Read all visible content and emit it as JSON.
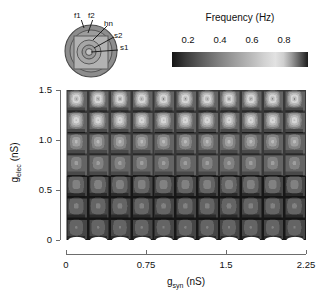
{
  "figure": {
    "inset": {
      "name": "neuron-schematic",
      "labels": [
        {
          "id": "f1",
          "text": "f1"
        },
        {
          "id": "f2",
          "text": "f2"
        },
        {
          "id": "hn",
          "text": "hn"
        },
        {
          "id": "s2",
          "text": "s2"
        },
        {
          "id": "s1",
          "text": "s1"
        }
      ]
    }
  },
  "colorbar": {
    "title": "Frequency (Hz)",
    "ticks": [
      0.2,
      0.4,
      0.6,
      0.8
    ],
    "tick_labels": [
      "0.2",
      "0.4",
      "0.6",
      "0.8"
    ],
    "range": [
      0.1,
      0.95
    ],
    "orientation": "horizontal"
  },
  "chart_data": {
    "type": "heatmap",
    "title": "",
    "xlabel": "g_syn (nS)",
    "xlabel_base": "g",
    "xlabel_sub": "syn",
    "xlabel_unit": " (nS)",
    "ylabel": "g_elec (nS)",
    "ylabel_base": "g",
    "ylabel_sub": "elec",
    "ylabel_unit": " (nS)",
    "xlim": [
      0,
      2.25
    ],
    "ylim": [
      0,
      1.5
    ],
    "xticks": [
      0,
      0.75,
      1.5,
      2.25
    ],
    "xtick_labels": [
      "0",
      "0.75",
      "1.5",
      "2.25"
    ],
    "yticks": [
      0,
      0.5,
      1.0,
      1.5
    ],
    "ytick_labels": [
      "0",
      "0.5",
      "1.0",
      "1.5"
    ],
    "grid": false,
    "colorbar_label": "Frequency (Hz)",
    "zlim": [
      0.1,
      0.95
    ],
    "pattern": {
      "description": "periodic tiled nested-contour cells",
      "cells_x": 11,
      "cells_y": 7,
      "cell_width_nS": 0.205,
      "cell_height_nS": 0.214
    },
    "row_peak_frequency": [
      0.88,
      0.8,
      0.62,
      0.52,
      0.46,
      0.42,
      0.4
    ],
    "row_base_frequency": [
      0.33,
      0.32,
      0.3,
      0.29,
      0.28,
      0.27,
      0.26
    ],
    "colormap": "gray-peaked"
  }
}
